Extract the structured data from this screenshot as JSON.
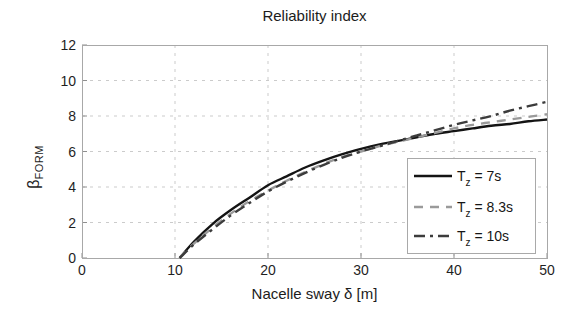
{
  "figure": {
    "background": "#ffffff"
  },
  "chart_data": {
    "type": "line",
    "title": "Reliability index",
    "xlabel": "Nacelle sway δ [m]",
    "ylabel": "β_FORM",
    "ylabel_main": "β",
    "ylabel_sub": "FORM",
    "xlim": [
      0,
      50
    ],
    "ylim": [
      0,
      12
    ],
    "xticks": [
      0,
      10,
      20,
      30,
      40,
      50
    ],
    "yticks": [
      0,
      2,
      4,
      6,
      8,
      10,
      12
    ],
    "grid": true,
    "grid_color": "#cbcbcb",
    "axis_color": "#a8a8a8",
    "tick_color": "#8f8f8f",
    "text_color": "#1f1f1f",
    "legend": {
      "position": "lower-right-inside",
      "border_color": "#a9a9a9",
      "background": "#ffffff",
      "entries": [
        {
          "label": "Tz = 7s",
          "label_main": "T",
          "label_sub": "z",
          "label_rest": " = 7s"
        },
        {
          "label": "Tz = 8.3s",
          "label_main": "T",
          "label_sub": "z",
          "label_rest": " = 8.3s"
        },
        {
          "label": "Tz = 10s",
          "label_main": "T",
          "label_sub": "z",
          "label_rest": " = 10s"
        }
      ]
    },
    "x": [
      10.5,
      12,
      14,
      16,
      18,
      20,
      22,
      24,
      26,
      28,
      30,
      32,
      34,
      36,
      38,
      40,
      42,
      44,
      46,
      48,
      50
    ],
    "series": [
      {
        "name": "Tz = 7s",
        "line_style": "solid",
        "color": "#141414",
        "values": [
          0,
          0.9,
          1.9,
          2.7,
          3.4,
          4.1,
          4.6,
          5.1,
          5.5,
          5.85,
          6.15,
          6.4,
          6.6,
          6.8,
          7.0,
          7.15,
          7.3,
          7.45,
          7.55,
          7.7,
          7.8
        ]
      },
      {
        "name": "Tz = 8.3s",
        "line_style": "dashed",
        "color": "#9a9a9a",
        "values": [
          0,
          0.8,
          1.7,
          2.5,
          3.2,
          3.8,
          4.35,
          4.85,
          5.3,
          5.7,
          6.0,
          6.3,
          6.55,
          6.8,
          7.05,
          7.3,
          7.5,
          7.65,
          7.8,
          7.95,
          8.1
        ]
      },
      {
        "name": "Tz = 10s",
        "line_style": "dashdot",
        "color": "#3c3c3c",
        "values": [
          0,
          0.75,
          1.6,
          2.4,
          3.1,
          3.75,
          4.3,
          4.8,
          5.25,
          5.65,
          6.0,
          6.3,
          6.6,
          6.9,
          7.2,
          7.5,
          7.75,
          8.0,
          8.3,
          8.55,
          8.8
        ]
      }
    ]
  }
}
